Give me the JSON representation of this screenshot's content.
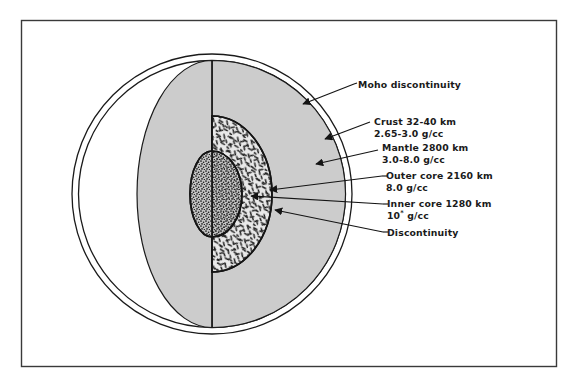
{
  "figure": {
    "frame_color": "#3a3a3a",
    "background_color": "#ffffff",
    "mantle_fill": "#cccccc",
    "crust_fill": "#ffffff",
    "outer_core_fill": "#e8e8e8",
    "inner_core_fill": "#bdbdbd",
    "line_color": "#1a1a1a"
  },
  "labels": [
    {
      "id": "moho",
      "name": "moho-discontinuity",
      "line1": "Moho discontinuity",
      "line2": "",
      "x": 358,
      "y": 79
    },
    {
      "id": "crust",
      "name": "crust",
      "line1": "Crust 32-40 km",
      "line2": "2.65-3.0 g/cc",
      "x": 374,
      "y": 116
    },
    {
      "id": "mantle",
      "name": "mantle",
      "line1": "Mantle 2800 km",
      "line2": "3.0-8.0 g/cc",
      "x": 382,
      "y": 142
    },
    {
      "id": "outer-core",
      "name": "outer-core",
      "line1": "Outer core 2160 km",
      "line2": "8.0 g/cc",
      "x": 386,
      "y": 170
    },
    {
      "id": "inner-core",
      "name": "inner-core",
      "line1": "Inner core 1280 km",
      "line2_pre": "10",
      "line2_sup": "*",
      "line2_post": " g/cc",
      "x": 387,
      "y": 198
    },
    {
      "id": "discontinuity",
      "name": "discontinuity",
      "line1": "Discontinuity",
      "line2": "",
      "x": 387,
      "y": 227
    }
  ],
  "geometry": {
    "frame": {
      "x": 21,
      "y": 20,
      "w": 536,
      "h": 347
    },
    "earth_circle": {
      "cx": 212,
      "cy": 194,
      "r": 140
    },
    "crust_inner_circle": {
      "cx": 212,
      "cy": 194,
      "r": 134
    },
    "cut_face_ellipse": {
      "cx": 212,
      "cy": 194,
      "rx": 75,
      "ry": 134
    },
    "outer_core_ellipse": {
      "cx": 212,
      "cy": 194,
      "rx": 60,
      "ry": 78
    },
    "inner_core_ellipse": {
      "cx": 212,
      "cy": 194,
      "rx": 30,
      "ry": 43
    },
    "center_axis_x": 212
  },
  "leaders": [
    {
      "id": "moho",
      "from": [
        354,
        84
      ],
      "to": [
        303,
        104
      ]
    },
    {
      "id": "crust",
      "from": [
        370,
        122
      ],
      "to": [
        324,
        138
      ]
    },
    {
      "id": "mantle",
      "from": [
        378,
        150
      ],
      "to": [
        318,
        163
      ]
    },
    {
      "id": "outer-core",
      "from": [
        382,
        176
      ],
      "to": [
        269,
        190
      ]
    },
    {
      "id": "inner-core",
      "from": [
        383,
        204
      ],
      "to": [
        252,
        196
      ]
    },
    {
      "id": "discontinuity",
      "from": [
        383,
        232
      ],
      "to": [
        274,
        209
      ]
    }
  ]
}
